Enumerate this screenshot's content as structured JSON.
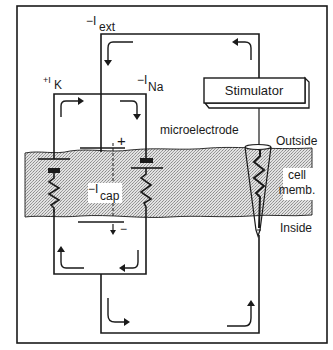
{
  "diagram": {
    "labels": {
      "i_ext_sign": "−I",
      "i_ext_sub": "ext",
      "i_k_sign": "+I",
      "i_k_sub": "K",
      "i_na_sign": "−I",
      "i_na_sub": "Na",
      "i_cap_sign": "−I",
      "i_cap_sub": "cap",
      "stimulator": "Stimulator",
      "microelectrode": "microelectrode",
      "outside": "Outside",
      "cell_memb_line1": "cell",
      "cell_memb_line2": "memb.",
      "inside": "Inside",
      "cap_plus": "+",
      "cap_minus": "−"
    },
    "components": [
      {
        "name": "K battery and resistor branch",
        "current": "+I_K"
      },
      {
        "name": "membrane capacitor",
        "current": "−I_cap"
      },
      {
        "name": "Na battery and resistor branch",
        "current": "−I_Na"
      },
      {
        "name": "stimulator with microelectrode",
        "current": "−I_ext"
      }
    ],
    "colors": {
      "line": "#1a1a1a",
      "membrane_fill": "#c8c8c8",
      "background": "#ffffff"
    }
  }
}
